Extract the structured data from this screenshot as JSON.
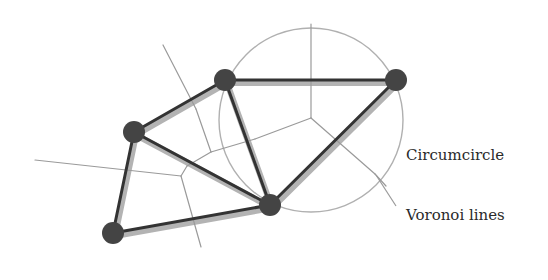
{
  "diagram": {
    "labels": {
      "circumcircle": "Circumcircle",
      "voronoi": "Voronoi lines"
    },
    "colors": {
      "edge": "#333333",
      "edge_shadow": "#9a9a9a",
      "node": "#444444",
      "voronoi": "#9a9a9a",
      "circle": "#b0b0b0",
      "text": "#2a2a2a"
    },
    "nodes": [
      {
        "id": "A",
        "x": 225,
        "y": 80
      },
      {
        "id": "B",
        "x": 396,
        "y": 80
      },
      {
        "id": "C",
        "x": 134,
        "y": 132
      },
      {
        "id": "D",
        "x": 270,
        "y": 205
      },
      {
        "id": "E",
        "x": 113,
        "y": 233
      }
    ],
    "edges": [
      [
        "C",
        "A"
      ],
      [
        "A",
        "B"
      ],
      [
        "A",
        "D"
      ],
      [
        "B",
        "D"
      ],
      [
        "C",
        "D"
      ],
      [
        "C",
        "E"
      ],
      [
        "E",
        "D"
      ]
    ],
    "circumcircle": {
      "cx": 311,
      "cy": 120,
      "r": 92
    },
    "voronoi_segments": [
      [
        311,
        118,
        311,
        24
      ],
      [
        311,
        118,
        255,
        139
      ],
      [
        311,
        118,
        375,
        174
      ],
      [
        375,
        174,
        386,
        186
      ],
      [
        255,
        139,
        211,
        152
      ],
      [
        211,
        152,
        187,
        166
      ],
      [
        211,
        152,
        196,
        109
      ],
      [
        196,
        109,
        163,
        45
      ],
      [
        187,
        166,
        181,
        176
      ],
      [
        181,
        176,
        35,
        160
      ],
      [
        181,
        176,
        201,
        247
      ]
    ],
    "leader_lines": {
      "circumcircle": [
        398,
        150,
        403,
        150
      ],
      "voronoi": [
        376,
        175,
        396,
        206
      ]
    }
  }
}
